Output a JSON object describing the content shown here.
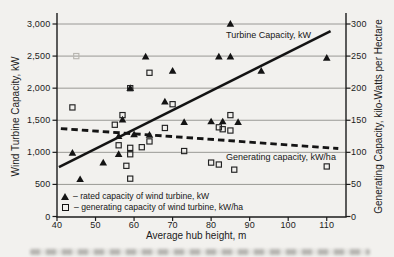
{
  "figure": {
    "background": "#f2f1ee",
    "ink": "#1b1b1b",
    "grid_color": "#8f8e8a",
    "faint_marker_color": "#b9b7b1"
  },
  "chart_data": {
    "type": "scatter",
    "title": "",
    "xlabel": "Average hub height, m",
    "ylabel_left": "Wind Turbine Capacity, kW",
    "ylabel_right": "Generating Capacity, kilo-Watts per Hectare",
    "xlim": [
      40,
      115
    ],
    "ylim_left": [
      0,
      3000
    ],
    "ylim_right": [
      0,
      300
    ],
    "grid": "horizontal",
    "xticks": [
      "40",
      "50",
      "60",
      "70",
      "80",
      "90",
      "100",
      "110"
    ],
    "yticks_left": [
      "0",
      "500",
      "1,000",
      "1,500",
      "2,000",
      "2,500",
      "3,000"
    ],
    "yticks_right": [
      "0",
      "50",
      "100",
      "150",
      "200",
      "250",
      "300"
    ],
    "series": [
      {
        "name": "rated capacity of wind turbine, kW",
        "marker": "filled-triangle",
        "axis": "left",
        "points": [
          [
            44,
            990
          ],
          [
            46,
            580
          ],
          [
            52,
            840
          ],
          [
            56,
            970
          ],
          [
            56,
            1250
          ],
          [
            57,
            1510
          ],
          [
            59,
            2000
          ],
          [
            60,
            1280
          ],
          [
            63,
            2490
          ],
          [
            64,
            1270
          ],
          [
            68,
            1790
          ],
          [
            70,
            2270
          ],
          [
            73,
            1470
          ],
          [
            80,
            1480
          ],
          [
            82,
            2490
          ],
          [
            83,
            1480
          ],
          [
            85,
            2490
          ],
          [
            85,
            3000
          ],
          [
            87,
            1470
          ],
          [
            93,
            2270
          ],
          [
            110,
            2470
          ]
        ]
      },
      {
        "name": "generating capacity of wind turbine, kW/ha",
        "marker": "open-square",
        "axis": "right",
        "points": [
          [
            44,
            170
          ],
          [
            55,
            143
          ],
          [
            56,
            111
          ],
          [
            57,
            158
          ],
          [
            58,
            79
          ],
          [
            59,
            59
          ],
          [
            59,
            97
          ],
          [
            59,
            107
          ],
          [
            59,
            200
          ],
          [
            62,
            108
          ],
          [
            64,
            117
          ],
          [
            64,
            224
          ],
          [
            68,
            138
          ],
          [
            70,
            175
          ],
          [
            73,
            102
          ],
          [
            80,
            84
          ],
          [
            82,
            81
          ],
          [
            82,
            139
          ],
          [
            83,
            136
          ],
          [
            85,
            134
          ],
          [
            85,
            158
          ],
          [
            86,
            73
          ],
          [
            110,
            78
          ]
        ],
        "faint_points": [
          [
            45,
            250
          ]
        ]
      }
    ],
    "trend_lines": [
      {
        "label": "Turbine Capacity, kW",
        "style": "solid",
        "axis": "left",
        "points": [
          [
            40.5,
            770
          ],
          [
            111,
            2890
          ]
        ]
      },
      {
        "label": "Generating capacity, kW/ha",
        "style": "dashed",
        "axis": "right",
        "points": [
          [
            41,
            137
          ],
          [
            113,
            106
          ]
        ]
      }
    ],
    "legend_position": "inside-bottom-left"
  },
  "legend": {
    "items": [
      {
        "symbol": "filled-triangle-icon",
        "label": "– rated capacity of wind turbine, kW"
      },
      {
        "symbol": "open-square-icon",
        "label": "– generating capacity of wind turbine, kW/ha"
      }
    ]
  }
}
